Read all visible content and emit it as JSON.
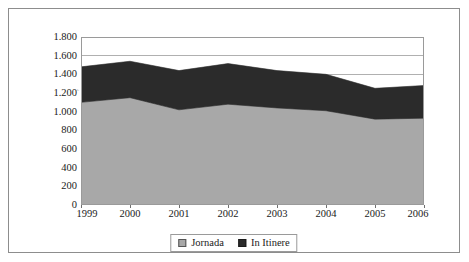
{
  "figure": {
    "top_cut_text": "",
    "scan_mark": "‸"
  },
  "chart_data": {
    "type": "area",
    "stacked": true,
    "title": "",
    "subtitle": "",
    "xlabel": "",
    "ylabel": "",
    "x": [
      1999,
      2000,
      2001,
      2002,
      2003,
      2004,
      2005,
      2006
    ],
    "categories": [
      "1999",
      "2000",
      "2001",
      "2002",
      "2003",
      "2004",
      "2005",
      "2006"
    ],
    "series": [
      {
        "name": "Jornada",
        "color": "#a8a8a8",
        "values": [
          1100,
          1150,
          1020,
          1080,
          1040,
          1010,
          920,
          930
        ]
      },
      {
        "name": "In Itinere",
        "color": "#2b2b2b",
        "values": [
          380,
          390,
          420,
          435,
          400,
          390,
          330,
          350
        ]
      }
    ],
    "totals": [
      1480,
      1540,
      1440,
      1515,
      1440,
      1400,
      1250,
      1280
    ],
    "ylim": [
      0,
      1800
    ],
    "ytick_values": [
      0,
      200,
      400,
      600,
      800,
      1000,
      1200,
      1400,
      1600,
      1800
    ],
    "ytick_labels": [
      "0",
      "200",
      "400",
      "600",
      "800",
      "1.000",
      "1.200",
      "1.400",
      "1.600",
      "1.800"
    ],
    "grid": true,
    "grid_axis": "y",
    "legend_position": "bottom",
    "legend_entries": [
      "Jornada",
      "In Itinere"
    ]
  },
  "colors": {
    "jornada": "#a8a8a8",
    "in_itinere": "#2b2b2b",
    "frame": "#8d8d8d",
    "grid": "#b0b0b0",
    "axis": "#6f6f6f",
    "text": "#1a1a1a",
    "background": "#ffffff"
  }
}
